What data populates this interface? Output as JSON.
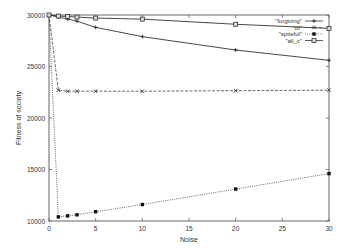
{
  "chart_data": {
    "type": "line",
    "title": "",
    "xlabel": "Noise",
    "ylabel": "Fitness of society",
    "xlim": [
      0,
      30
    ],
    "ylim": [
      10000,
      30000
    ],
    "xticks": [
      0,
      5,
      10,
      15,
      20,
      25,
      30
    ],
    "yticks": [
      10000,
      15000,
      20000,
      25000,
      30000
    ],
    "grid": false,
    "legend_position": "top-right",
    "x": [
      0,
      1,
      2,
      3,
      5,
      10,
      20,
      30
    ],
    "series": [
      {
        "name": "\"forgiving\"",
        "style": "solid",
        "marker": "plus",
        "values": [
          30000,
          29800,
          29600,
          29400,
          28800,
          27900,
          26600,
          25600
        ]
      },
      {
        "name": "\"tft\"",
        "style": "dashed",
        "marker": "cross",
        "values": [
          30000,
          22700,
          22600,
          22600,
          22600,
          22600,
          22650,
          22700
        ]
      },
      {
        "name": "\"spiteful\"",
        "style": "dotted",
        "marker": "filled-square",
        "values": [
          30000,
          10400,
          10500,
          10600,
          10900,
          11600,
          13100,
          14600
        ]
      },
      {
        "name": "\"all_c\"",
        "style": "solid",
        "marker": "open-square",
        "values": [
          30000,
          29900,
          29850,
          29800,
          29700,
          29600,
          29100,
          28700
        ]
      }
    ]
  }
}
